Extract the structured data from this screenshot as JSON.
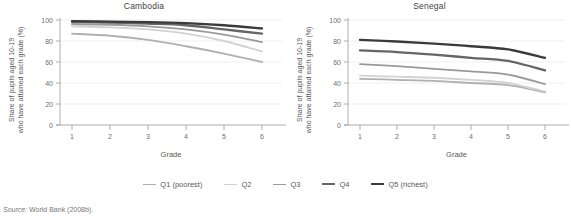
{
  "figure": {
    "source_prefix": "Source:",
    "source_text": "World Bank (2008b)."
  },
  "legend": {
    "position": "bottom-center",
    "items": [
      {
        "label": "Q1 (poorest)",
        "color": "#b0b0b0"
      },
      {
        "label": "Q2",
        "color": "#d2d2d2"
      },
      {
        "label": "Q3",
        "color": "#9a9a9a"
      },
      {
        "label": "Q4",
        "color": "#666666"
      },
      {
        "label": "Q5 (richest)",
        "color": "#3a3a3a"
      }
    ]
  },
  "panels": [
    {
      "id": "cambodia",
      "title": "Cambodia",
      "xlabel": "Grade",
      "ylabel_line1": "Share of pupils aged 10-19",
      "ylabel_line2": "who have attained each grade (%)"
    },
    {
      "id": "senegal",
      "title": "Senegal",
      "xlabel": "Grade",
      "ylabel_line1": "Share of pupils aged 10-19",
      "ylabel_line2": "who have attained each grade (%)"
    }
  ],
  "chart_data": [
    {
      "type": "line",
      "title": "Cambodia",
      "xlabel": "Grade",
      "ylabel": "Share of pupils aged 10-19 who have attained each grade (%)",
      "x": [
        1,
        2,
        3,
        4,
        5,
        6
      ],
      "xtick_labels": [
        "1",
        "2",
        "3",
        "4",
        "5",
        "6"
      ],
      "ytick_labels": [
        "0",
        "20",
        "40",
        "60",
        "80",
        "100"
      ],
      "xlim": [
        0.72,
        6.55
      ],
      "ylim": [
        0,
        100
      ],
      "grid": "horizontal",
      "legend": "bottom-shared",
      "series": [
        {
          "name": "Q1 (poorest)",
          "color": "#b0b0b0",
          "values": [
            87,
            85,
            81,
            75,
            68,
            60
          ]
        },
        {
          "name": "Q2",
          "color": "#d2d2d2",
          "values": [
            94,
            93,
            91,
            87,
            80,
            70
          ]
        },
        {
          "name": "Q3",
          "color": "#9a9a9a",
          "values": [
            96,
            95.5,
            94,
            91,
            86,
            79
          ]
        },
        {
          "name": "Q4",
          "color": "#666666",
          "values": [
            98,
            97.5,
            96.5,
            95,
            91,
            87
          ]
        },
        {
          "name": "Q5 (richest)",
          "color": "#3a3a3a",
          "values": [
            99,
            98.5,
            98,
            97,
            95,
            92
          ]
        }
      ]
    },
    {
      "type": "line",
      "title": "Senegal",
      "xlabel": "Grade",
      "ylabel": "Share of pupils aged 10-19 who have attained each grade (%)",
      "x": [
        1,
        2,
        3,
        4,
        5,
        6
      ],
      "xtick_labels": [
        "1",
        "2",
        "3",
        "4",
        "5",
        "6"
      ],
      "ytick_labels": [
        "0",
        "20",
        "40",
        "60",
        "80",
        "100"
      ],
      "xlim": [
        0.72,
        6.55
      ],
      "ylim": [
        0,
        100
      ],
      "grid": "horizontal",
      "legend": "bottom-shared",
      "series": [
        {
          "name": "Q1 (poorest)",
          "color": "#b0b0b0",
          "values": [
            44,
            43,
            42,
            40,
            38,
            31
          ]
        },
        {
          "name": "Q2",
          "color": "#d2d2d2",
          "values": [
            47,
            46,
            45,
            43,
            40,
            32
          ]
        },
        {
          "name": "Q3",
          "color": "#9a9a9a",
          "values": [
            58,
            56,
            53.5,
            51,
            48,
            39
          ]
        },
        {
          "name": "Q4",
          "color": "#666666",
          "values": [
            71,
            69.5,
            67,
            64,
            61,
            52
          ]
        },
        {
          "name": "Q5 (richest)",
          "color": "#3a3a3a",
          "values": [
            81,
            79.5,
            77.5,
            75,
            72,
            64
          ]
        }
      ]
    }
  ]
}
